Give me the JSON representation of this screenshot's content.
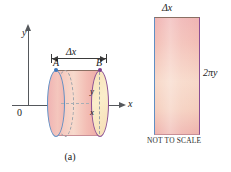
{
  "figure": {
    "panels": [
      {
        "id": "a",
        "caption": "(a)",
        "labels": {
          "y_axis": "y",
          "x_axis": "x",
          "origin": "0",
          "point_a": "A",
          "point_b": "B",
          "inner_y": "y",
          "inner_x": "x",
          "measure": "|← Δx →|",
          "measure_text": "Δx"
        },
        "colors": {
          "left_cap_outline": "#5f8fc4",
          "right_cap_outline": "#8a4f93",
          "shell_fill_start": "#f2b9b6",
          "shell_fill_mid": "#f7d9cc",
          "right_cap_fill": "#fbeecb",
          "axis": "#55585c",
          "dashed": "#9aa0a8",
          "dot_a": "#3b76bb",
          "dot_b": "#7b3f8c"
        }
      },
      {
        "id": "b",
        "caption": "(b)",
        "labels": {
          "top": "Δx",
          "right": "2πy",
          "note": "NOT TO SCALE"
        },
        "colors": {
          "left_edge": "#5f8fc4",
          "right_edge": "#8a4f93",
          "top_edge": "#8a6f63",
          "bottom_edge": "#c98f96",
          "fill_start": "#f0b4b3",
          "fill_mid": "#f7d8c8",
          "fill_end": "#efb3ad"
        }
      }
    ]
  }
}
